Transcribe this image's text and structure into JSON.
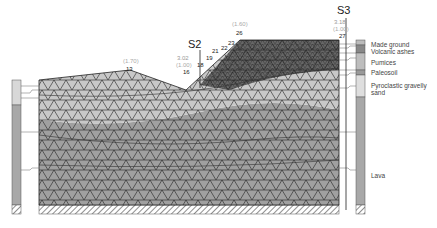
{
  "stations": [
    {
      "id": "S2",
      "label": "S2",
      "value": "3.02",
      "paren": "(1.00)",
      "x": 200
    },
    {
      "id": "S3",
      "label": "S3",
      "value": "3.18",
      "paren": "(1.00)",
      "x": 346
    }
  ],
  "node_labels": [
    {
      "text": "13",
      "paren": "(1.70)",
      "x": 130,
      "y": 72
    },
    {
      "text": "16",
      "x": 186,
      "y": 87
    },
    {
      "text": "18",
      "x": 199,
      "y": 80
    },
    {
      "text": "19",
      "x": 210,
      "y": 72
    },
    {
      "text": "21",
      "x": 214,
      "y": 63
    },
    {
      "text": "22",
      "x": 222,
      "y": 60
    },
    {
      "text": "23",
      "x": 230,
      "y": 55
    },
    {
      "text": "26",
      "x": 238,
      "y": 46,
      "paren": "(1.60)"
    },
    {
      "text": "27",
      "x": 343,
      "y": 37
    }
  ],
  "legend": [
    {
      "label": "Made ground",
      "y": 45
    },
    {
      "label": "Volcanic ashes",
      "y": 52
    },
    {
      "label": "Pumices",
      "y": 63
    },
    {
      "label": "Paleosoil",
      "y": 73
    },
    {
      "label": "Pyroclastic gravelly",
      "y": 85
    },
    {
      "label": "sand",
      "y": 92
    },
    {
      "label": "Lava",
      "y": 176
    }
  ],
  "colors": {
    "lava": "#a0a0a0",
    "upper": "#c8c8c8",
    "mesh": "#222222",
    "column_light": "#d8d8d8",
    "column_dark": "#a8a8a8"
  }
}
